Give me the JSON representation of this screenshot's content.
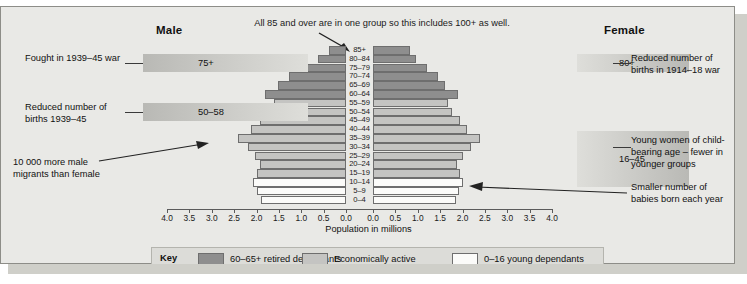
{
  "headings": {
    "male": "Male",
    "female": "Female"
  },
  "top_note": "All 85 and over are in one group so this includes 100+ as well.",
  "axis": {
    "title": "Population in millions",
    "left_ticks": [
      "4.0",
      "3.5",
      "3.0",
      "2.5",
      "2.0",
      "1.5",
      "1.0",
      "0.5",
      "0.0"
    ],
    "right_ticks": [
      "0.0",
      "0.5",
      "1.0",
      "1.5",
      "2.0",
      "2.5",
      "3.0",
      "3.5",
      "4.0"
    ],
    "max": 4.0
  },
  "bands": [
    {
      "name": "fought-war",
      "value": "75+",
      "text": "Fought in 1939–45 war",
      "side": "left"
    },
    {
      "name": "reduced-births-39",
      "value": "50–58",
      "text": "Reduced number of births 1939–45",
      "side": "left"
    },
    {
      "name": "reduced-births-14",
      "value": "80+",
      "text": "Reduced number of births in 1914–18 war",
      "side": "right"
    },
    {
      "name": "child-bearing",
      "value": "16–45",
      "text": "Young women of child-bearing age – fewer in younger groups",
      "side": "right"
    }
  ],
  "annotations": {
    "migrants": "10 000 more male migrants than female",
    "babies": "Smaller number of babies born each year"
  },
  "key": {
    "label": "Key",
    "items": [
      {
        "name": "retired",
        "text": "60–65+ retired dependants",
        "color": "#8e8e8e"
      },
      {
        "name": "active",
        "text": "Economically active",
        "color": "#c4c4c2"
      },
      {
        "name": "young",
        "text": "0–16 young dependants",
        "color": "#fbfbf9"
      }
    ]
  },
  "chart_data": {
    "type": "bar",
    "orientation": "population-pyramid",
    "xlabel": "Population in millions",
    "ylabel": "Age group",
    "xlim": [
      0,
      4.0
    ],
    "grid": false,
    "categories": [
      "0–4",
      "5–9",
      "10–14",
      "15–19",
      "20–24",
      "25–29",
      "30–34",
      "35–39",
      "40–44",
      "45–49",
      "50–54",
      "55–59",
      "60–64",
      "65–69",
      "70–74",
      "75–79",
      "80–84",
      "85+"
    ],
    "series": [
      {
        "name": "Male",
        "values": [
          1.9,
          1.98,
          2.08,
          2.0,
          1.92,
          2.04,
          2.2,
          2.42,
          2.12,
          1.92,
          1.72,
          1.62,
          1.82,
          1.52,
          1.28,
          0.92,
          0.62,
          0.38
        ]
      },
      {
        "name": "Female",
        "values": [
          1.86,
          1.92,
          2.0,
          1.94,
          1.88,
          2.0,
          2.18,
          2.4,
          2.1,
          1.94,
          1.76,
          1.68,
          1.9,
          1.62,
          1.46,
          1.2,
          0.96,
          0.82
        ]
      }
    ],
    "category_groups": {
      "young dependants (white)": [
        "0–4",
        "5–9",
        "10–14"
      ],
      "economically active (mid grey)": [
        "15–19",
        "20–24",
        "25–29",
        "30–34",
        "35–39",
        "40–44",
        "45–49",
        "50–54",
        "55–59"
      ],
      "retired dependants (dark grey)": [
        "60–64",
        "65–69",
        "70–74",
        "75–79",
        "80–84",
        "85+"
      ]
    },
    "legend": [
      "60–65+ retired dependants",
      "Economically active",
      "0–16 young dependants"
    ],
    "legend_position": "bottom"
  }
}
